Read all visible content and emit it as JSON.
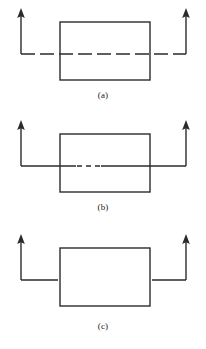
{
  "figure": {
    "title": "",
    "width": 206,
    "height": 349,
    "background": "#ffffff",
    "stroke_color": "#2b2b2b",
    "stroke_width": 1.4
  },
  "panels": [
    {
      "id": "a",
      "caption": "(a)",
      "description": "Rectangle with horizontal dashed line passing fully through it, arrows pointing up at both outer ends",
      "rectangle": {
        "x": 60,
        "y": 22,
        "width": 90,
        "height": 58
      },
      "line": {
        "style": "dashed",
        "y": 54,
        "x_start": 21,
        "x_end": 186,
        "dash_pattern": "14 5",
        "crosses_rectangle": true
      },
      "arrows": [
        {
          "name": "left-arrow",
          "x": 21,
          "y_top": 10,
          "y_bottom": 54,
          "direction": "up"
        },
        {
          "name": "right-arrow",
          "x": 186,
          "y_top": 10,
          "y_bottom": 54,
          "direction": "up"
        }
      ]
    },
    {
      "id": "b",
      "caption": "(b)",
      "description": "Rectangle with solid horizontal line through it, broken by a short dashed gap inside the rectangle, arrows pointing up at both outer ends",
      "rectangle": {
        "x": 60,
        "y": 22,
        "width": 90,
        "height": 58
      },
      "line": {
        "style": "solid-with-dashed-gap",
        "y": 54,
        "x_start": 21,
        "x_end": 186,
        "gap_x_start": 76,
        "gap_x_end": 100,
        "dash_pattern": "5 4",
        "crosses_rectangle": true
      },
      "arrows": [
        {
          "name": "left-arrow",
          "x": 21,
          "y_top": 10,
          "y_bottom": 54,
          "direction": "up"
        },
        {
          "name": "right-arrow",
          "x": 186,
          "y_top": 10,
          "y_bottom": 54,
          "direction": "up"
        }
      ]
    },
    {
      "id": "c",
      "caption": "(c)",
      "description": "Rectangle with no line inside; solid horizontal lines stop at the left and right rectangle edges, arrows pointing up at both outer ends",
      "rectangle": {
        "x": 60,
        "y": 22,
        "width": 90,
        "height": 58
      },
      "line": {
        "style": "solid-interrupted",
        "y": 54,
        "x_start": 21,
        "x_end": 186,
        "gap_x_start": 58,
        "gap_x_end": 152,
        "crosses_rectangle": false
      },
      "arrows": [
        {
          "name": "left-arrow",
          "x": 21,
          "y_top": 10,
          "y_bottom": 54,
          "direction": "up"
        },
        {
          "name": "right-arrow",
          "x": 186,
          "y_top": 10,
          "y_bottom": 54,
          "direction": "up"
        }
      ]
    }
  ]
}
